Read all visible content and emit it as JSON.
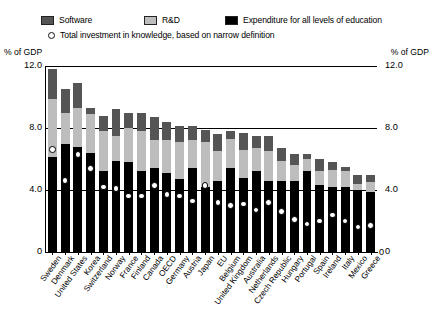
{
  "legend": {
    "items": [
      {
        "label": "Software",
        "color": "#555555",
        "marker": "square"
      },
      {
        "label": "R&D",
        "color": "#bdbdbd",
        "marker": "square"
      },
      {
        "label": "Expenditure for all levels of education",
        "color": "#000000",
        "marker": "square"
      },
      {
        "label": "Total investment in knowledge, based on narrow definition",
        "color": "#ffffff",
        "marker": "circle"
      }
    ]
  },
  "axis": {
    "left_caption": "% of GDP",
    "right_caption": "% of GDP",
    "ticks": [
      "12.0",
      "8.0",
      "4.0",
      "0"
    ],
    "tick_values": [
      12.0,
      8.0,
      4.0,
      0
    ]
  },
  "chart_data": {
    "type": "bar",
    "stacked": true,
    "title": "",
    "xlabel": "",
    "ylabel": "% of GDP",
    "ylim": [
      0,
      12
    ],
    "yticks": [
      0,
      4,
      8,
      12
    ],
    "grid": true,
    "legend_position": "top",
    "categories": [
      "Sweden",
      "Denmark",
      "United States",
      "Korea",
      "Switzerland",
      "Norway",
      "France",
      "Finland",
      "Canada",
      "OECD",
      "Germany",
      "Austria",
      "Japan",
      "EU",
      "Belgium",
      "United Kingdom",
      "Australia",
      "Netherlands",
      "Czech Republic",
      "Hungary",
      "Portugal",
      "Spain",
      "Ireland",
      "Italy",
      "Mexico",
      "Greece"
    ],
    "series": [
      {
        "name": "Expenditure for all levels of education",
        "color": "#000000",
        "values": [
          6.1,
          7.0,
          6.8,
          6.4,
          5.2,
          5.9,
          5.8,
          5.2,
          5.4,
          5.1,
          4.7,
          5.4,
          4.2,
          4.6,
          5.4,
          4.8,
          5.2,
          4.6,
          4.6,
          4.6,
          5.2,
          4.3,
          4.2,
          4.2,
          4.0,
          3.9
        ]
      },
      {
        "name": "R&D",
        "color": "#bdbdbd",
        "values": [
          3.8,
          2.0,
          2.5,
          2.5,
          2.6,
          1.6,
          2.2,
          2.6,
          1.8,
          2.1,
          2.4,
          1.8,
          2.9,
          1.9,
          1.9,
          1.8,
          1.5,
          1.9,
          1.3,
          1.0,
          0.8,
          0.9,
          1.1,
          1.0,
          0.4,
          0.6
        ]
      },
      {
        "name": "Software",
        "color": "#555555",
        "values": [
          1.9,
          1.5,
          1.6,
          0.4,
          1.0,
          1.7,
          1.0,
          1.2,
          1.5,
          1.2,
          1.0,
          0.9,
          0.8,
          1.1,
          0.5,
          1.1,
          0.8,
          1.0,
          0.8,
          0.7,
          0.3,
          0.8,
          0.5,
          0.3,
          0.6,
          0.5
        ]
      }
    ],
    "totals": [
      11.8,
      10.5,
      10.9,
      9.3,
      8.8,
      9.2,
      9.0,
      9.0,
      8.7,
      8.4,
      8.1,
      8.1,
      7.9,
      7.6,
      7.8,
      7.7,
      7.5,
      7.5,
      6.7,
      6.3,
      6.3,
      6.0,
      5.8,
      5.5,
      5.0,
      5.0
    ],
    "narrow_definition": {
      "name": "Total investment in knowledge, based on narrow definition",
      "marker": "open-circle",
      "values": [
        6.6,
        4.6,
        6.3,
        5.4,
        4.2,
        4.1,
        3.6,
        3.6,
        4.3,
        3.7,
        3.6,
        3.3,
        4.3,
        3.2,
        3.0,
        3.1,
        2.7,
        3.2,
        2.6,
        2.1,
        1.8,
        2.0,
        2.4,
        2.0,
        1.6,
        1.7
      ]
    }
  }
}
